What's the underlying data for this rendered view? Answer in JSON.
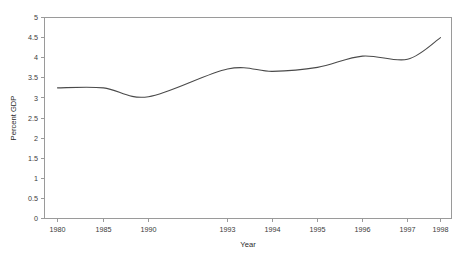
{
  "chart_data": {
    "type": "line",
    "title": "",
    "xlabel": "Year",
    "ylabel": "Percent GDP",
    "grid": false,
    "legend": "none",
    "line_color": "#4a4a4a",
    "axis_color": "#9a9a9a",
    "background_color": "#ffffff",
    "ylim": [
      0,
      5
    ],
    "y_ticks": [
      "0",
      "0.5",
      "1",
      "1.5",
      "2",
      "2.5",
      "3",
      "3.5",
      "4",
      "4.5",
      "5"
    ],
    "y_tick_values": [
      0,
      0.5,
      1,
      1.5,
      2,
      2.5,
      3,
      3.5,
      4,
      4.5,
      5
    ],
    "x_tick_labels": [
      "1980",
      "1985",
      "1990",
      "1993",
      "1994",
      "1995",
      "1996",
      "1997",
      "1998"
    ],
    "x_tick_values": [
      1980,
      1985,
      1990,
      1993,
      1994,
      1995,
      1996,
      1997,
      1998
    ],
    "categories": [
      1980,
      1985,
      1990,
      1993,
      1994,
      1995,
      1996,
      1997,
      1998
    ],
    "values": [
      3.25,
      3.25,
      3.03,
      3.72,
      3.66,
      3.76,
      4.04,
      3.96,
      4.5
    ],
    "series": [
      {
        "name": "Percent GDP",
        "x": [
          1980,
          1985,
          1990,
          1993,
          1994,
          1995,
          1996,
          1997,
          1998
        ],
        "values": [
          3.25,
          3.25,
          3.03,
          3.72,
          3.66,
          3.76,
          4.04,
          3.96,
          4.5
        ]
      }
    ]
  }
}
